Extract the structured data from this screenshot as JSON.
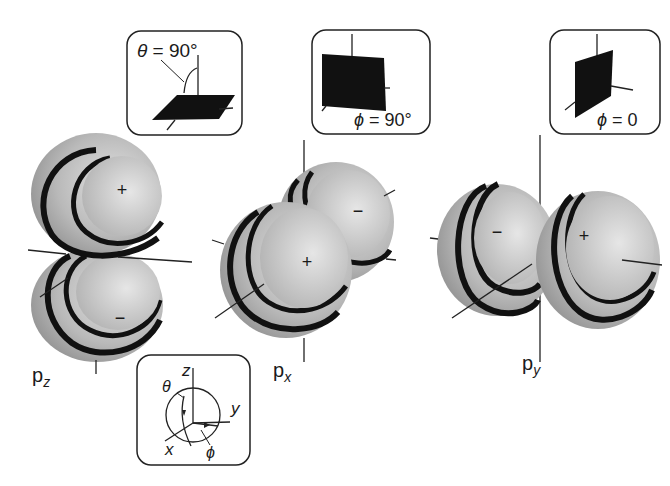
{
  "figure": {
    "colors": {
      "lobe_fill": "#a9a9a9",
      "lobe_highlight": "#dcdcdc",
      "band": "#111111",
      "plane": "#111111",
      "axis": "#222222",
      "box_border": "#222222"
    }
  },
  "orbitals": [
    {
      "id": "pz",
      "label_main": "p",
      "label_sub": "z",
      "lobe_signs": [
        "+",
        "−"
      ],
      "nodal_inset": {
        "caption": "θ = 90°",
        "var": "θ",
        "value": "90°"
      }
    },
    {
      "id": "px",
      "label_main": "p",
      "label_sub": "x",
      "lobe_signs": [
        "−",
        "+"
      ],
      "nodal_inset": {
        "caption": "ϕ = 90°",
        "var": "ϕ",
        "value": "90°"
      }
    },
    {
      "id": "py",
      "label_main": "p",
      "label_sub": "y",
      "lobe_signs": [
        "−",
        "+"
      ],
      "nodal_inset": {
        "caption": "ϕ = 0",
        "var": "ϕ",
        "value": "0"
      }
    }
  ],
  "coordinate_inset": {
    "axes": [
      "z",
      "y",
      "x"
    ],
    "angles": [
      "θ",
      "ϕ"
    ]
  }
}
